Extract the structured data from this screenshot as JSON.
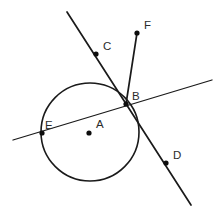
{
  "figure": {
    "type": "geometry-diagram",
    "canvas": {
      "width": 216,
      "height": 214
    },
    "colors": {
      "stroke": "#1a1a1a",
      "label": "#2b2b2b",
      "point": "#0d0d0d",
      "background": "#ffffff"
    },
    "circle": {
      "name": "circle-a",
      "center_label": "A",
      "cx": 90,
      "cy": 132,
      "r": 49
    },
    "points": [
      {
        "id": "A",
        "label": "A",
        "x": 89,
        "y": 133,
        "label_x": 96,
        "label_y": 128,
        "role": "circle-center"
      },
      {
        "id": "B",
        "label": "B",
        "x": 126,
        "y": 104,
        "label_x": 132,
        "label_y": 100,
        "role": "intersection-on-circle"
      },
      {
        "id": "C",
        "label": "C",
        "x": 96,
        "y": 54,
        "label_x": 103,
        "label_y": 50,
        "role": "point-on-line-cd"
      },
      {
        "id": "D",
        "label": "D",
        "x": 166,
        "y": 163,
        "label_x": 173,
        "label_y": 159,
        "role": "point-on-line-cd"
      },
      {
        "id": "E",
        "label": "E",
        "x": 42,
        "y": 133,
        "label_x": 45,
        "label_y": 129,
        "role": "secant-circle-intersection"
      },
      {
        "id": "F",
        "label": "F",
        "x": 137,
        "y": 33,
        "label_x": 144,
        "label_y": 29,
        "role": "segment-endpoint"
      }
    ],
    "lines": [
      {
        "id": "line-cd",
        "name": "secant-line-cd",
        "x1": 67,
        "y1": 12,
        "x2": 191,
        "y2": 205,
        "width": 1.7,
        "through": [
          "C",
          "B",
          "D"
        ]
      },
      {
        "id": "line-eb",
        "name": "secant-line-eb",
        "x1": 13,
        "y1": 140,
        "x2": 212,
        "y2": 80,
        "width": 1.3,
        "through": [
          "E",
          "B"
        ]
      },
      {
        "id": "segment-fb",
        "name": "segment-fb",
        "x1": 137,
        "y1": 33,
        "x2": 126,
        "y2": 104,
        "width": 1.7,
        "through": [
          "F",
          "B"
        ]
      }
    ],
    "dot_radius": 2.6,
    "center_dot_radius": 2.6
  }
}
